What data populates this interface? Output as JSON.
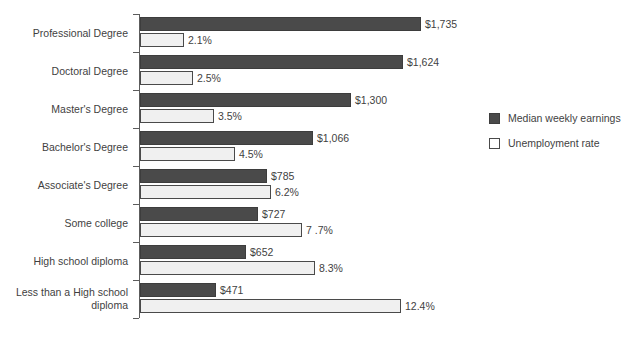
{
  "chart_data": {
    "type": "bar",
    "title": "",
    "subtitle": "",
    "xlabel": "",
    "ylabel": "",
    "orientation": "horizontal",
    "grid": false,
    "legend_position": "right",
    "categories": [
      "Professional Degree",
      "Doctoral Degree",
      "Master's Degree",
      "Bachelor's Degree",
      "Associate's Degree",
      "Some college",
      "High school diploma",
      "Less than a High school\ndiploma"
    ],
    "series": [
      {
        "name": "Median weekly earnings",
        "unit": "USD",
        "color": "#4a4a4a",
        "values": [
          1735,
          1624,
          1300,
          1066,
          785,
          727,
          652,
          471
        ],
        "labels": [
          "$1,735",
          "$1,624",
          "$1,300",
          "$1,066",
          "$785",
          "$727",
          "$652",
          "$471"
        ],
        "axis_max": 1735
      },
      {
        "name": "Unemployment rate",
        "unit": "percent",
        "color": "#f0f0f0",
        "values": [
          2.1,
          2.5,
          3.5,
          4.5,
          6.2,
          7.7,
          8.3,
          12.4
        ],
        "labels": [
          "2.1%",
          "2.5%",
          "3.5%",
          "4.5%",
          "6.2%",
          "7 .7%",
          "8.3%",
          "12.4%"
        ],
        "axis_max": 12.4
      }
    ]
  },
  "legend": {
    "items": [
      {
        "label": "Median weekly earnings",
        "swatch": "filled-dark-square"
      },
      {
        "label": "Unemployment rate",
        "swatch": "outlined-white-square"
      }
    ]
  },
  "colors": {
    "earnings_bar": "#4a4a4a",
    "unemployment_bar": "#f0f0f0",
    "bar_border": "#4a4a4a",
    "axis": "#5c5c5c",
    "text": "#3f3f3f",
    "background": "#ffffff"
  }
}
